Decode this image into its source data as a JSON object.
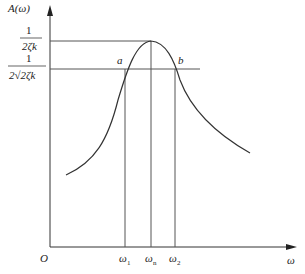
{
  "diagram": {
    "y_axis_label": "A(ω)",
    "x_axis_label": "ω",
    "origin_label": "O",
    "peak_value_label": {
      "numerator": "1",
      "denominator": "2ζk"
    },
    "half_power_label": {
      "numerator": "1",
      "denominator": "2√2ζk"
    },
    "points": {
      "a": "a",
      "b": "b"
    },
    "x_ticks": [
      {
        "base": "ω",
        "sub": "1"
      },
      {
        "base": "ω",
        "sub": "n"
      },
      {
        "base": "ω",
        "sub": "2"
      }
    ],
    "colors": {
      "axis": "#333333",
      "curve": "#333333",
      "guides": "#555555"
    }
  }
}
